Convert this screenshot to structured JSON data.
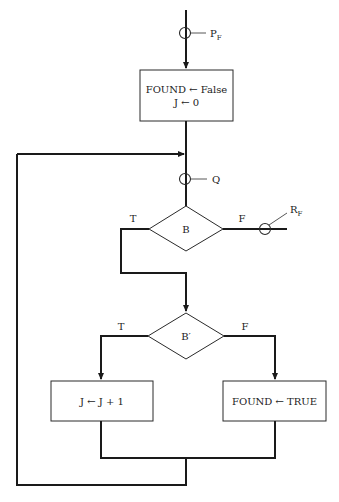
{
  "diagram": {
    "type": "flowchart",
    "start_probe": {
      "label": "P",
      "subscript": "F"
    },
    "init_box": {
      "line1": "FOUND ← False",
      "line2": "J ← 0"
    },
    "loop_probe": {
      "label": "Q"
    },
    "decision_b": {
      "label": "B",
      "true_label": "T",
      "false_label": "F"
    },
    "exit_probe": {
      "label": "R",
      "subscript": "F"
    },
    "decision_b_prime": {
      "label": "B′",
      "true_label": "T",
      "false_label": "F"
    },
    "increment_box": {
      "text": "J ← J + 1"
    },
    "found_box": {
      "text": "FOUND ← TRUE"
    }
  }
}
